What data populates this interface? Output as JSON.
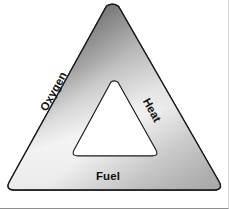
{
  "figure": {
    "name": "fire-triangle",
    "alt_title": "Fire triangle diagram",
    "background_color": "#ffffff",
    "frame_color": "#8e8e8e"
  },
  "shape": {
    "outer_triangle": {
      "name": "outer-triangle",
      "outline_color": "#1a1a1a",
      "outline_width": 1.2,
      "corner_radius": 9,
      "gradient": {
        "type": "linear",
        "angle_deg": 135,
        "stops": [
          {
            "offset": 0,
            "color": "#9a9a9a"
          },
          {
            "offset": 0.18,
            "color": "#6d6d6d"
          },
          {
            "offset": 0.42,
            "color": "#efefef"
          },
          {
            "offset": 0.58,
            "color": "#fbfbfb"
          },
          {
            "offset": 0.78,
            "color": "#b4b4b4"
          },
          {
            "offset": 1,
            "color": "#7c7c7c"
          }
        ]
      }
    },
    "inner_triangle": {
      "name": "inner-triangle",
      "fill_color": "#ffffff",
      "outline_color": "#1a1a1a",
      "outline_width": 1.1,
      "corner_radius": 5
    }
  },
  "labels": {
    "oxygen": "Oxygen",
    "heat": "Heat",
    "fuel": "Fuel"
  }
}
